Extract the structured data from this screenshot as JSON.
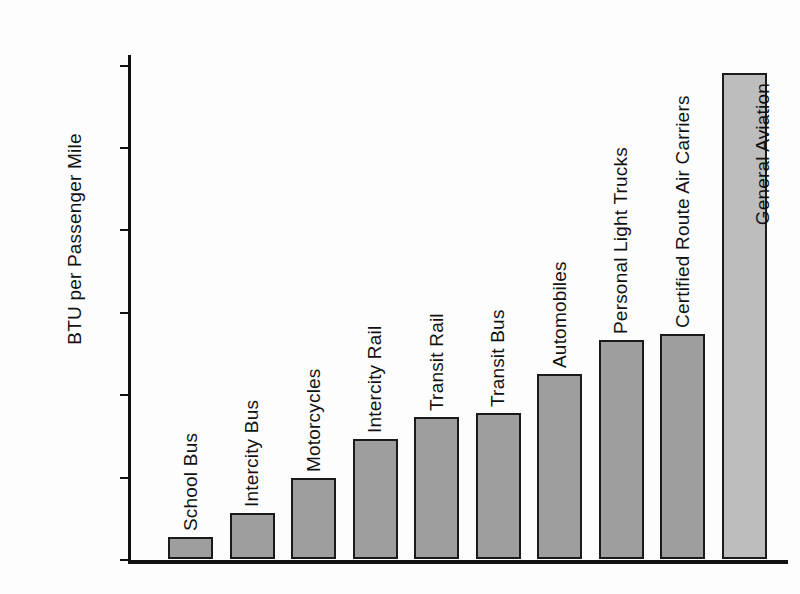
{
  "chart_data": {
    "type": "bar",
    "title": "",
    "xlabel": "",
    "ylabel": "BTU per Passenger Mile",
    "ylim": [
      0,
      13000
    ],
    "grid": false,
    "legend": null,
    "ytick_labels": [
      "12,000",
      "10,000",
      "8000",
      "6000",
      "4000",
      "2000",
      "0"
    ],
    "ytick_values": [
      12000,
      10000,
      8000,
      6000,
      4000,
      2000,
      0
    ],
    "categories": [
      "School Bus",
      "Intercity Bus",
      "Motorcycles",
      "Intercity Rail",
      "Transit Rail",
      "Transit Bus",
      "Automobiles",
      "Personal Light Trucks",
      "Certified Route Air Carriers",
      "General Aviation"
    ],
    "values": [
      540,
      1120,
      1970,
      2910,
      3450,
      3550,
      4490,
      5310,
      5460,
      11800
    ],
    "bar_fill_color": "#9e9e9e",
    "bar_highlight_fill_color": "#bdbdbd",
    "bar_edge_color": "#1a1a1a",
    "axis_color": "#111111",
    "background_color": "#ffffff"
  }
}
